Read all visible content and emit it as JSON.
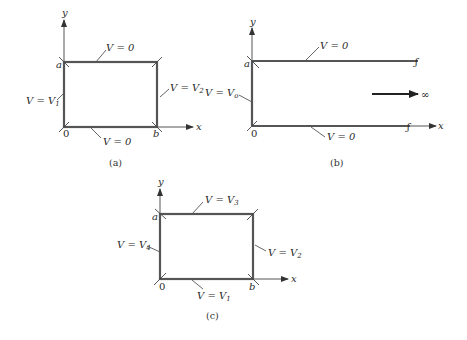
{
  "panels": {
    "a": {
      "caption": "(a)",
      "axis_x": "x",
      "axis_y": "y",
      "corner_origin": "0",
      "corner_a": "a",
      "corner_b": "b",
      "top_label": "V = 0",
      "bottom_label": "V = 0",
      "left_label_prefix": "V = V",
      "left_label_sub": "1",
      "right_label_prefix": "V = V",
      "right_label_sub": "2"
    },
    "b": {
      "caption": "(b)",
      "axis_x": "x",
      "axis_y": "y",
      "corner_origin": "0",
      "corner_a": "a",
      "top_label": "V = 0",
      "bottom_label": "V = 0",
      "left_label_prefix": "V = V",
      "left_label_sub": "o",
      "infinity": "∞",
      "break_mark": "ʃ"
    },
    "c": {
      "caption": "(c)",
      "axis_x": "x",
      "axis_y": "y",
      "corner_origin": "0",
      "corner_a": "a",
      "corner_b": "b",
      "top_label_prefix": "V = V",
      "top_label_sub": "3",
      "bottom_label_prefix": "V = V",
      "bottom_label_sub": "1",
      "left_label_prefix": "V = V",
      "left_label_sub": "4",
      "right_label_prefix": "V = V",
      "right_label_sub": "2"
    }
  },
  "colors": {
    "line": "#555555",
    "text": "#2a2a2a",
    "background": "#ffffff"
  }
}
